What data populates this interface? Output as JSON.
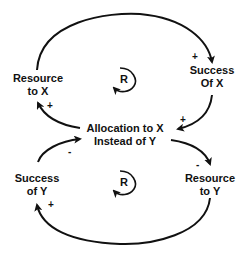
{
  "diagram": {
    "type": "causal-loop-diagram",
    "nodes": {
      "resource_x": {
        "line1": "Resource",
        "line2": "to X"
      },
      "success_x": {
        "line1": "Success",
        "line2": "Of X"
      },
      "allocation": {
        "line1": "Allocation to X",
        "line2": "Instead of Y"
      },
      "success_y": {
        "line1": "Success",
        "line2": "of Y"
      },
      "resource_y": {
        "line1": "Resource",
        "line2": "to Y"
      }
    },
    "loops": [
      {
        "label": "R",
        "type": "reinforcing"
      },
      {
        "label": "R",
        "type": "reinforcing"
      }
    ],
    "links": [
      {
        "from": "Resource to X",
        "to": "Success Of X",
        "polarity": "+"
      },
      {
        "from": "Success Of X",
        "to": "Allocation to X Instead of Y",
        "polarity": "+"
      },
      {
        "from": "Allocation to X Instead of Y",
        "to": "Resource to X",
        "polarity": "+"
      },
      {
        "from": "Allocation to X Instead of Y",
        "to": "Resource to Y",
        "polarity": "-"
      },
      {
        "from": "Resource to Y",
        "to": "Success of Y",
        "polarity": "+"
      },
      {
        "from": "Success of Y",
        "to": "Allocation to X Instead of Y",
        "polarity": "-"
      }
    ]
  }
}
